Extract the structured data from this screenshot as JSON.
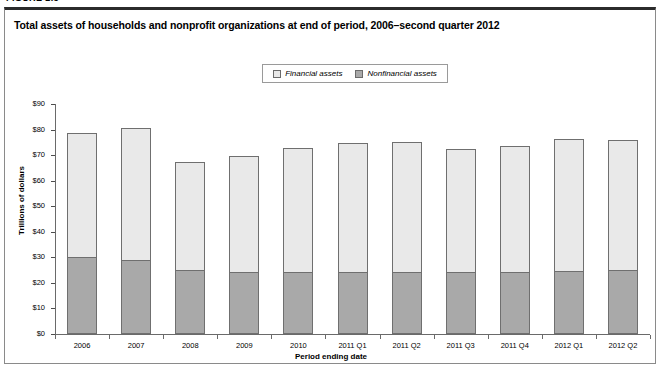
{
  "figure": {
    "label": "FIGURE 2.3"
  },
  "chart_title": "Total assets of households and nonprofit organizations at end of period, 2006–second quarter 2012",
  "legend": {
    "items": [
      {
        "label": "Financial assets",
        "color": "#e9e9e9",
        "name": "financial-assets"
      },
      {
        "label": "Nonfinancial assets",
        "color": "#a9a9a9",
        "name": "nonfinancial-assets"
      }
    ]
  },
  "axes": {
    "y_title": "Trillions of dollars",
    "x_title": "Period ending date",
    "y_ticks": [
      "$0",
      "$10",
      "$20",
      "$30",
      "$40",
      "$50",
      "$60",
      "$70",
      "$80",
      "$90"
    ]
  },
  "colors": {
    "financial": "#e9e9e9",
    "nonfinancial": "#a9a9a9",
    "border": "#6f6f6f",
    "axis": "#6a6a6a",
    "frame_top": "#2b2b2b",
    "frame": "#8a8a8a"
  },
  "chart_data": {
    "type": "bar",
    "subtype": "stacked-column",
    "title": "Total assets of households and nonprofit organizations at end of period, 2006–second quarter 2012",
    "xlabel": "Period ending date",
    "ylabel": "Trillions of dollars",
    "ylim": [
      0,
      90
    ],
    "ytick_step": 10,
    "grid": false,
    "legend_position": "top-center",
    "units": "Trillions of dollars",
    "categories": [
      "2006",
      "2007",
      "2008",
      "2009",
      "2010",
      "2011 Q1",
      "2011 Q2",
      "2011 Q3",
      "2011 Q4",
      "2012 Q1",
      "2012 Q2"
    ],
    "series": [
      {
        "name": "Nonfinancial assets",
        "color": "#a9a9a9",
        "values": [
          29.7,
          28.4,
          24.8,
          23.9,
          23.8,
          23.8,
          24.0,
          23.8,
          23.9,
          24.1,
          24.5
        ]
      },
      {
        "name": "Financial assets",
        "color": "#e9e9e9",
        "values": [
          49.1,
          52.3,
          42.7,
          45.8,
          49.1,
          50.8,
          51.0,
          48.4,
          49.8,
          52.4,
          51.6
        ]
      }
    ],
    "totals": [
      78.8,
      80.7,
      67.5,
      69.7,
      72.9,
      74.6,
      75.0,
      72.2,
      73.7,
      76.5,
      76.1
    ]
  }
}
